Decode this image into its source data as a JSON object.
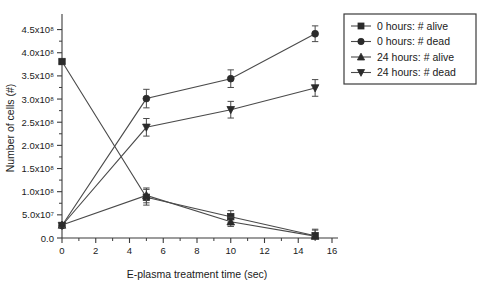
{
  "chart_data": {
    "type": "line",
    "title": "",
    "xlabel": "E-plasma treatment time (sec)",
    "ylabel": "Number of cells (#)",
    "xlim": [
      0,
      16
    ],
    "ylim": [
      0,
      475000000
    ],
    "grid": false,
    "legend_position": "right-top",
    "x_ticks": [
      0,
      2,
      4,
      6,
      8,
      10,
      12,
      14,
      16
    ],
    "x_tick_labels": [
      "0",
      "2",
      "4",
      "6",
      "8",
      "10",
      "12",
      "14",
      "16"
    ],
    "x_minor_ticks": [
      1,
      3,
      5,
      7,
      9,
      11,
      13,
      15
    ],
    "y_ticks": [
      0,
      50000000,
      100000000,
      150000000,
      200000000,
      250000000,
      300000000,
      350000000,
      400000000,
      450000000
    ],
    "y_tick_labels": [
      "0.0",
      "5.0x10⁷",
      "1.0x10⁸",
      "1.5x10⁸",
      "2.0x10⁸",
      "2.5x10⁸",
      "3.0x10⁸",
      "3.5x10⁸",
      "4.0x10⁸",
      "4.5x10⁸"
    ],
    "x": [
      0,
      5,
      10,
      15
    ],
    "series": [
      {
        "name": "0 hours: # alive",
        "marker": "square",
        "values": [
          381000000,
          88000000,
          46000000,
          5000000
        ],
        "errors": [
          4000000,
          17000000,
          13000000,
          14000000
        ]
      },
      {
        "name": "0 hours: # dead",
        "marker": "circle",
        "values": [
          27000000,
          301000000,
          344000000,
          441000000
        ],
        "errors": [
          4000000,
          20000000,
          19000000,
          17000000
        ]
      },
      {
        "name": "24 hours: # alive",
        "marker": "triangle-up",
        "values": [
          28000000,
          92000000,
          35000000,
          4000000
        ],
        "errors": [
          4000000,
          16000000,
          10000000,
          13000000
        ]
      },
      {
        "name": "24 hours: # dead",
        "marker": "triangle-down",
        "values": [
          27000000,
          239000000,
          277000000,
          324000000
        ],
        "errors": [
          4000000,
          19000000,
          18000000,
          18000000
        ]
      }
    ]
  },
  "legend": {
    "items": [
      {
        "label": "0 hours: # alive",
        "marker": "square"
      },
      {
        "label": "0 hours: # dead",
        "marker": "circle"
      },
      {
        "label": "24 hours: # alive",
        "marker": "triangle-up"
      },
      {
        "label": "24 hours: # dead",
        "marker": "triangle-down"
      }
    ]
  }
}
